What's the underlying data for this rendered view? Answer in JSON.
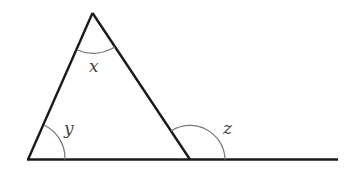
{
  "diagram": {
    "type": "geometry-triangle-exterior-angle",
    "labels": {
      "apex_angle": "x",
      "base_left_angle": "y",
      "exterior_angle": "z"
    },
    "colors": {
      "line": "#1a1a1a",
      "arc": "#777777",
      "label": "#444444",
      "background": "#ffffff"
    }
  }
}
